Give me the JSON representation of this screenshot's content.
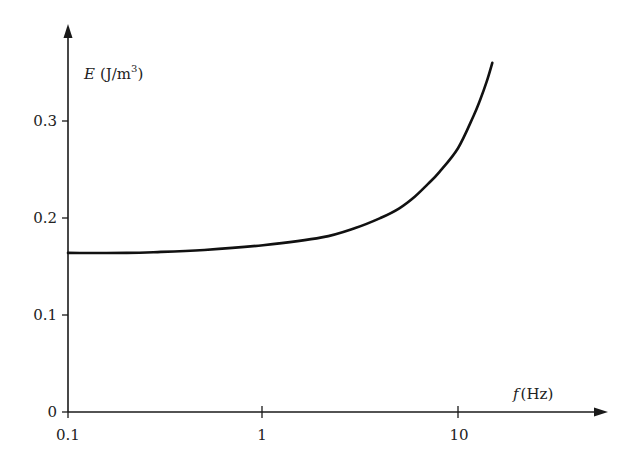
{
  "chart_data": {
    "type": "line",
    "title": "",
    "xlabel": "f (Hz)",
    "ylabel": "E (J/m³)",
    "xlabel_var": "f",
    "xlabel_unit": "(Hz)",
    "ylabel_var": "E",
    "ylabel_unit": "(J/m",
    "ylabel_unit_sup": "3",
    "ylabel_unit_close": ")",
    "x_scale": "log",
    "xlim": [
      0.1,
      50
    ],
    "ylim": [
      0,
      0.38
    ],
    "x_ticks": [
      0.1,
      1,
      10
    ],
    "x_tick_labels": [
      "0.1",
      "1",
      "10"
    ],
    "y_ticks": [
      0,
      0.1,
      0.2,
      0.3
    ],
    "y_tick_labels": [
      "0",
      "0.1",
      "0.2",
      "0.3"
    ],
    "grid": false,
    "legend": null,
    "series": [
      {
        "name": "E",
        "x": [
          0.1,
          0.2,
          0.3,
          0.5,
          1,
          2,
          3,
          4,
          5,
          6,
          7,
          8,
          10,
          12,
          13,
          14,
          15
        ],
        "values": [
          0.164,
          0.164,
          0.165,
          0.167,
          0.172,
          0.18,
          0.19,
          0.2,
          0.21,
          0.222,
          0.235,
          0.247,
          0.272,
          0.305,
          0.322,
          0.34,
          0.36
        ]
      }
    ]
  },
  "labels": {
    "x0": "0.1",
    "x1": "1",
    "x2": "10",
    "y0": "0",
    "y1": "0.1",
    "y2": "0.2",
    "y3": "0.3"
  }
}
